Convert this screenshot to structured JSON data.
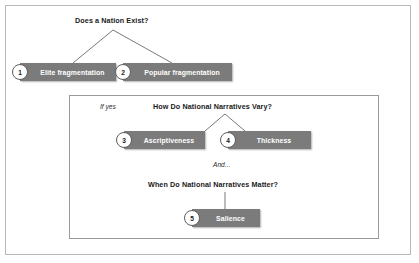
{
  "figure": {
    "title": "Does a Nation Exist?",
    "headings": {
      "q1": "Does a Nation Exist?",
      "q2": "How Do National Narratives Vary?",
      "q3": "When Do National Narratives Matter?"
    },
    "notes": {
      "if_yes": "If yes",
      "and": "And..."
    },
    "nodes": [
      {
        "number": "1",
        "label": "Elite fragmentation"
      },
      {
        "number": "2",
        "label": "Popular fragmentation"
      },
      {
        "number": "3",
        "label": "Ascriptiveness"
      },
      {
        "number": "4",
        "label": "Thickness"
      },
      {
        "number": "5",
        "label": "Salience"
      }
    ],
    "colors": {
      "node_fill": "#7b7b7b",
      "node_text": "#ffffff",
      "circle_fill": "#ffffff",
      "circle_border": "#5d5d5d",
      "connector": "#3f3f3f",
      "outer_border": "#b9b9b9",
      "inner_border": "#9a9a9a",
      "background": "#ffffff"
    }
  }
}
